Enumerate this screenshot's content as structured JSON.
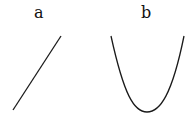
{
  "panels": [
    {
      "label": "a",
      "curve": "straight line (linear, positive slope)"
    },
    {
      "label": "b",
      "curve": "parabola (U-shaped, quadratic)"
    }
  ],
  "colors": {
    "stroke": "#1a1a1a",
    "background": "#ffffff"
  }
}
